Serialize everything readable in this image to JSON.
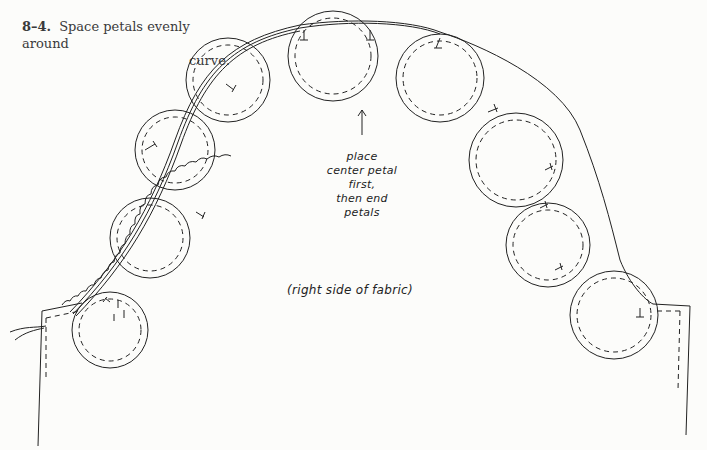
{
  "figure": {
    "number": "8–4.",
    "caption_line1": "Space petals evenly around",
    "caption_line2": "curve.",
    "annotations": {
      "petal_note": [
        "place",
        "center petal",
        "first,",
        "then end",
        "petals"
      ],
      "fabric_label": "(right side of fabric)"
    },
    "colors": {
      "ink": "#222222",
      "paper": "#fcfcfa"
    }
  }
}
